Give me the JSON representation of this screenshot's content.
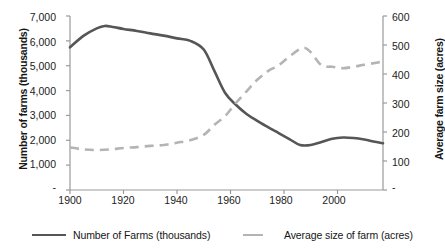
{
  "chart_data": {
    "type": "line",
    "title": "",
    "xlabel": "",
    "x_ticks": [
      1900,
      1920,
      1940,
      1960,
      1980,
      2000
    ],
    "xlim": [
      1900,
      2017
    ],
    "grid": false,
    "legend_position": "bottom",
    "axes": {
      "left": {
        "label": "Number of farms (thousands)",
        "ticks": [
          "-",
          "1,000",
          "2,000",
          "3,000",
          "4,000",
          "5,000",
          "6,000",
          "7,000"
        ],
        "tick_values": [
          0,
          1000,
          2000,
          3000,
          4000,
          5000,
          6000,
          7000
        ],
        "ylim": [
          0,
          7000
        ]
      },
      "right": {
        "label": "Average farm size (acres)",
        "ticks": [
          "-",
          "100",
          "200",
          "300",
          "400",
          "500",
          "600"
        ],
        "tick_values": [
          0,
          100,
          200,
          300,
          400,
          500,
          600
        ],
        "ylim": [
          0,
          600
        ]
      }
    },
    "series": [
      {
        "name": "Number of Farms (thousands)",
        "axis": "left",
        "color": "#565656",
        "style": "solid",
        "x": [
          1900,
          1905,
          1910,
          1913,
          1916,
          1920,
          1925,
          1930,
          1935,
          1940,
          1945,
          1950,
          1954,
          1958,
          1962,
          1966,
          1970,
          1974,
          1978,
          1982,
          1986,
          1990,
          1994,
          1998,
          2002,
          2006,
          2010,
          2014,
          2017
        ],
        "values": [
          5740,
          6200,
          6500,
          6600,
          6560,
          6480,
          6400,
          6300,
          6210,
          6100,
          6000,
          5650,
          4780,
          3900,
          3430,
          3060,
          2780,
          2530,
          2290,
          2050,
          1810,
          1810,
          1930,
          2060,
          2110,
          2090,
          2030,
          1940,
          1880
        ]
      },
      {
        "name": "Average size of farm (acres)",
        "axis": "right",
        "color": "#b4b4b4",
        "style": "dashed",
        "x": [
          1900,
          1905,
          1910,
          1915,
          1920,
          1925,
          1930,
          1935,
          1940,
          1945,
          1950,
          1954,
          1958,
          1962,
          1966,
          1970,
          1974,
          1978,
          1982,
          1987,
          1990,
          1994,
          1998,
          2002,
          2006,
          2010,
          2014,
          2017
        ],
        "values": [
          147,
          140,
          138,
          140,
          145,
          148,
          152,
          155,
          163,
          172,
          190,
          225,
          255,
          300,
          340,
          380,
          410,
          430,
          460,
          490,
          475,
          430,
          425,
          420,
          425,
          432,
          438,
          443
        ]
      }
    ]
  },
  "legend": {
    "items": [
      {
        "label": "Number of Farms (thousands)",
        "color": "#565656",
        "style": "solid"
      },
      {
        "label": "Average size of farm (acres)",
        "color": "#b4b4b4",
        "style": "dashed"
      }
    ]
  },
  "axis_colors": {
    "axis_line": "#9a9a9a",
    "tick_text": "#1c1c1c"
  }
}
